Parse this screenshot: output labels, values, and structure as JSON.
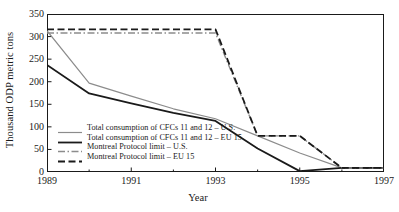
{
  "chart_data": {
    "type": "line",
    "title": "",
    "xlabel": "Year",
    "ylabel": "Thousand ODP metric tons",
    "xlim": [
      1989,
      1997
    ],
    "ylim": [
      0,
      350
    ],
    "xticks": [
      1989,
      1991,
      1993,
      1995,
      1997
    ],
    "xtick_labels": [
      "1989",
      "1991",
      "1993",
      "1995",
      "1997"
    ],
    "minor_xticks": [
      1990,
      1992,
      1994,
      1996
    ],
    "yticks": [
      0,
      50,
      100,
      150,
      200,
      250,
      300,
      350
    ],
    "ytick_labels": [
      "0",
      "50",
      "100",
      "150",
      "200",
      "250",
      "300",
      "350"
    ],
    "grid": false,
    "legend_position": "center-left",
    "x": [
      1989,
      1990,
      1991,
      1992,
      1993,
      1994,
      1995,
      1996,
      1997
    ],
    "series": [
      {
        "name": "Total consumption of CFCs 11 and 12 – U.S.",
        "style": "solid",
        "color": "#8c8c8c",
        "width": 1.2,
        "values": [
          313,
          197,
          168,
          140,
          118,
          80,
          42,
          9,
          9
        ]
      },
      {
        "name": "Total consumption of CFCs 11 and 12 – EU 15",
        "style": "solid",
        "color": "#1a1a1a",
        "width": 1.8,
        "values": [
          237,
          174,
          152,
          131,
          113,
          52,
          2,
          9,
          9
        ]
      },
      {
        "name": "Montreal Protocol limit – U.S.",
        "style": "dashdot",
        "color": "#8c8c8c",
        "width": 1.4,
        "values": [
          308,
          308,
          308,
          308,
          308,
          80,
          80,
          9,
          9
        ]
      },
      {
        "name": "Montreal Protocol limit – EU 15",
        "style": "dashed",
        "color": "#1a1a1a",
        "width": 1.8,
        "values": [
          316,
          316,
          316,
          316,
          316,
          80,
          80,
          9,
          9
        ]
      }
    ]
  },
  "axes": {
    "y_title": "Thousand ODP metric tons",
    "x_title": "Year"
  },
  "legend": {
    "items": [
      {
        "label": "Total consumption of CFCs 11 and 12 – U.S."
      },
      {
        "label": "Total consumption of CFCs 11 and 12 – EU 15"
      },
      {
        "label": "Montreal Protocol limit – U.S."
      },
      {
        "label": "Montreal Protocol limit – EU 15"
      }
    ]
  },
  "colors": {
    "axis": "#1a1a1a",
    "series_gray": "#8c8c8c",
    "series_black": "#1a1a1a",
    "background": "#ffffff"
  }
}
